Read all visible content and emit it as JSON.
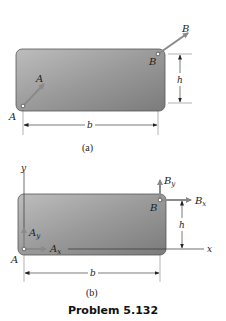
{
  "figure_a": {
    "caption": "(a)",
    "point_a_label": "A",
    "force_a_label": "A",
    "point_b_label": "B",
    "force_b_label": "B",
    "height_label": "h",
    "width_label": "b"
  },
  "figure_b": {
    "caption": "(b)",
    "point_a_label": "A",
    "point_b_label": "B",
    "force_ax_label": "A",
    "force_ax_sub": "x",
    "force_ay_label": "A",
    "force_ay_sub": "y",
    "force_bx_label": "B",
    "force_bx_sub": "x",
    "force_by_label": "B",
    "force_by_sub": "y",
    "x_axis_label": "x",
    "y_axis_label": "y",
    "height_label": "h",
    "width_label": "b"
  },
  "problem_label": "Problem 5.132",
  "colors": {
    "plate_light": "#b5b5b5",
    "plate_dark": "#6f6f6f",
    "arrow": "#7a7a7a",
    "line": "#333333"
  }
}
